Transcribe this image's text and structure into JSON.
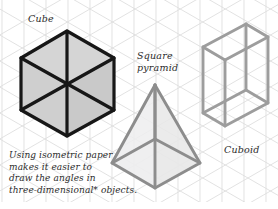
{
  "page": {
    "width": 278,
    "height": 209,
    "background_color": "#ffffff",
    "grid_type": "isometric-grid-paper",
    "grid_line_color": "#dcdcdc",
    "grid_spacing_px": 22
  },
  "labels": {
    "cube": "Cube",
    "square_pyramid": "Square\npyramid",
    "square_pyramid_line1": "Square",
    "square_pyramid_line2": "pyramid",
    "cuboid": "Cuboid"
  },
  "caption": {
    "line1": "Using isometric paper",
    "line2": "makes it easier to",
    "line3": "draw the angles in",
    "line4": "three-dimensional* objects.",
    "full_text": "Using isometric paper makes it easier to draw the angles in three-dimensional* objects."
  },
  "figures": {
    "cube": {
      "name": "cube",
      "shape": "isometric-hexagon",
      "outline_color": "#1a1a1a",
      "outline_width": 3.2,
      "spoke_color": "#1a1a1a",
      "spoke_width": 3.0,
      "face_top_fill": "#d4d4d4",
      "face_left_fill": "#cdcdcd",
      "face_right_fill": "#c8c8c8",
      "vertices": "67,31 114,58 114,110 67,136 21,110 21,58",
      "center": "67,84"
    },
    "square_pyramid": {
      "name": "square-pyramid",
      "shape": "isometric-pyramid",
      "outline_color": "#8c8c8c",
      "outline_width": 3.0,
      "face_left_fill": "#ececed",
      "face_right_fill": "#e6e6e7",
      "apex": "155,85",
      "base_left": "112,163",
      "base_right": "200,163",
      "base_front": "155,188",
      "base_back": "155,139"
    },
    "cuboid": {
      "name": "cuboid",
      "shape": "isometric-wireframe-box",
      "outline_color": "#9a9a9a",
      "outline_width": 3.0,
      "fill": "none",
      "front_top_left": "203,47",
      "front_top_right": "246,24",
      "top_back": "246,24",
      "height_px": 90,
      "depth_px": 43,
      "width_px": 43
    }
  }
}
